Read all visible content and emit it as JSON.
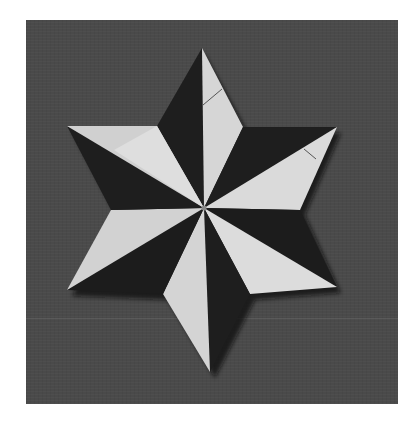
{
  "image": {
    "subject": "origami six-pointed star",
    "description": "Modular origami six-pointed star with alternating dark and light paper halves on each point, photographed on a gray textured background"
  },
  "colors": {
    "background_outer": "#ffffff",
    "background_photo": "#4a4a4a",
    "paper_dark": "#1e1e1e",
    "paper_light": "#d8d8d8",
    "shadow": "#111111"
  },
  "star": {
    "center": [
      204,
      208
    ],
    "points": [
      {
        "name": "top",
        "tip": [
          202,
          48
        ],
        "inner": [
          [
            157,
            126
          ],
          [
            243,
            127
          ]
        ],
        "dark_half": "left",
        "light_half": "right"
      },
      {
        "name": "upper-right",
        "tip": [
          337,
          127
        ],
        "inner": [
          [
            243,
            127
          ],
          [
            300,
            210
          ]
        ],
        "dark_half": "upper",
        "light_half": "lower"
      },
      {
        "name": "lower-right",
        "tip": [
          337,
          287
        ],
        "inner": [
          [
            300,
            210
          ],
          [
            250,
            294
          ]
        ],
        "dark_half": "upper",
        "light_half": "lower"
      },
      {
        "name": "bottom",
        "tip": [
          210,
          372
        ],
        "inner": [
          [
            250,
            294
          ],
          [
            163,
            294
          ]
        ],
        "dark_half": "right",
        "light_half": "left"
      },
      {
        "name": "lower-left",
        "tip": [
          67,
          290
        ],
        "inner": [
          [
            163,
            294
          ],
          [
            111,
            210
          ]
        ],
        "dark_half": "lower",
        "light_half": "upper"
      },
      {
        "name": "upper-left",
        "tip": [
          67,
          126
        ],
        "inner": [
          [
            111,
            210
          ],
          [
            157,
            126
          ]
        ],
        "dark_half": "lower",
        "light_half": "upper"
      }
    ]
  }
}
